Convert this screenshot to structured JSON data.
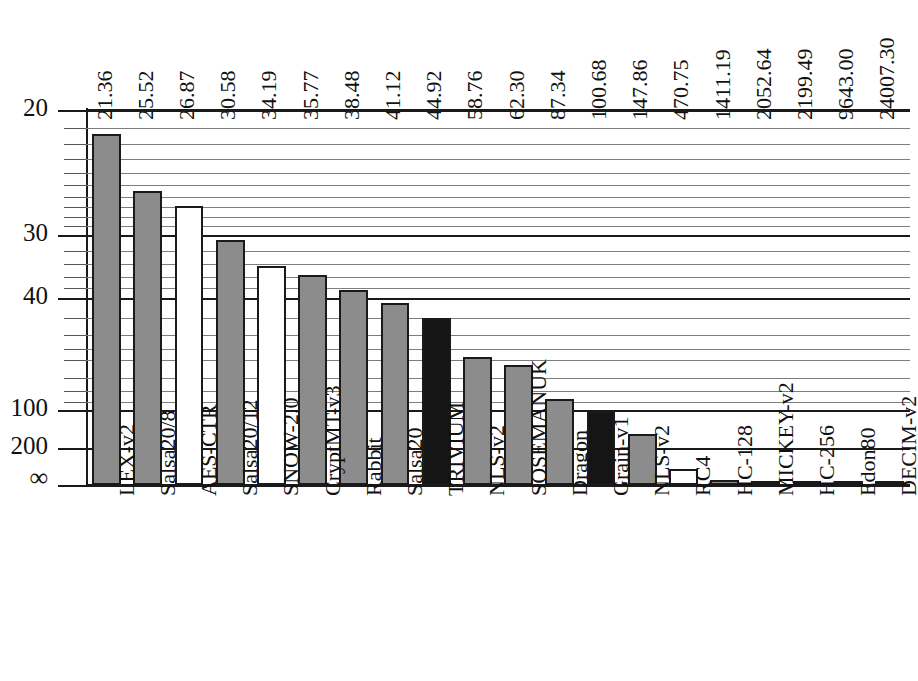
{
  "chart_data": {
    "type": "bar",
    "title": "",
    "subtitle": "",
    "xlabel": "",
    "ylabel": "",
    "orientation": "vertical",
    "grid": true,
    "legend_position": "none",
    "yaxis": {
      "scale": "reciprocal",
      "direction": "inverted",
      "tick_labels": [
        "20",
        "30",
        "40",
        "100",
        "200",
        "∞"
      ],
      "tick_values": [
        20,
        30,
        40,
        100,
        200,
        0
      ],
      "major_gridlines": [
        20,
        30,
        40,
        100,
        200,
        0
      ],
      "minor_gridlines": [
        21,
        22,
        23,
        24,
        25,
        26,
        27,
        28,
        29,
        32,
        34,
        36,
        38,
        45,
        50,
        55,
        60,
        70,
        80,
        90
      ],
      "ylim_top": 20,
      "ylim_bottom_label": "∞"
    },
    "categories": [
      "LEX-v2",
      "Salsa20/8",
      "AES-CTR",
      "Salsa20/12",
      "SNOW-2.0",
      "CryptMT-v3",
      "Rabbit",
      "Salsa20",
      "TRIVIUM",
      "NLS-v2",
      "SOSEMANUK",
      "Dragon",
      "Grain-v1",
      "NLS-v2",
      "RC4",
      "HC-128",
      "MICKEY-v2",
      "HC-256",
      "Edon80",
      "DECIM-v2"
    ],
    "values": [
      21.36,
      25.52,
      26.87,
      30.58,
      34.19,
      35.77,
      38.48,
      41.12,
      44.92,
      58.76,
      62.3,
      87.34,
      100.68,
      147.86,
      470.75,
      1411.19,
      2052.64,
      2199.49,
      9643.0,
      24007.3
    ],
    "value_labels": [
      "21.36",
      "25.52",
      "26.87",
      "30.58",
      "34.19",
      "35.77",
      "38.48",
      "41.12",
      "44.92",
      "58.76",
      "62.30",
      "87.34",
      "100.68",
      "147.86",
      "470.75",
      "1411.19",
      "2052.64",
      "2199.49",
      "9643.00",
      "24007.30"
    ],
    "bar_styles": [
      "gray",
      "gray",
      "white",
      "gray",
      "white",
      "gray",
      "gray",
      "gray",
      "black",
      "gray",
      "gray",
      "gray",
      "black",
      "gray",
      "white",
      "gray",
      "gray",
      "gray",
      "gray",
      "gray"
    ],
    "colors": {
      "gray": "#8c8c8c",
      "white": "#ffffff",
      "black": "#151515",
      "outline": "#1a1a1a",
      "gridline": "#7d7d7d",
      "gridline_major": "#1a1a1a",
      "text": "#111111"
    }
  },
  "caption": ""
}
